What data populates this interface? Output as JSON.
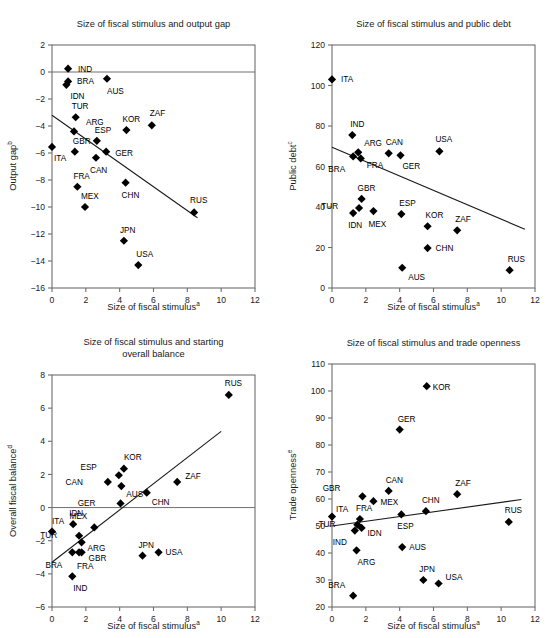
{
  "figure": {
    "panels_count": 4,
    "shared_xlabel": "Size of fiscal stimulus",
    "shared_xlabel_sup": "a"
  },
  "chart_data": [
    {
      "id": "output-gap",
      "type": "scatter",
      "title": "Size of fiscal stimulus and output gap",
      "xlabel": "Size of fiscal stimulus",
      "xlabel_sup": "a",
      "ylabel": "Output gap",
      "ylabel_sup": "b",
      "xlim": [
        0,
        12
      ],
      "ylim": [
        -16,
        2
      ],
      "xticks": [
        0,
        2,
        4,
        6,
        8,
        10,
        12
      ],
      "yticks": [
        2,
        0,
        -2,
        -4,
        -6,
        -8,
        -10,
        -12,
        -14,
        -16
      ],
      "grid": false,
      "legend": "none",
      "zero_line": 0,
      "trendline": {
        "x0": 0.0,
        "y0": -3.2,
        "x1": 8.6,
        "y1": -10.8
      },
      "points": [
        {
          "label": "IND",
          "x": 0.95,
          "y": 0.25,
          "lx": 10,
          "ly": 3
        },
        {
          "label": "BRA",
          "x": 0.95,
          "y": -0.7,
          "lx": 9,
          "ly": 3
        },
        {
          "label": "IDN",
          "x": 0.85,
          "y": -0.95,
          "lx": 4,
          "ly": 14
        },
        {
          "label": "AUS",
          "x": 3.25,
          "y": -0.5,
          "lx": 0,
          "ly": 15
        },
        {
          "label": "TUR",
          "x": 1.4,
          "y": -3.35,
          "lx": -4,
          "ly": -8
        },
        {
          "label": "ARG",
          "x": 1.3,
          "y": -4.4,
          "lx": 12,
          "ly": -6
        },
        {
          "label": "KOR",
          "x": 4.4,
          "y": -4.3,
          "lx": -4,
          "ly": -8
        },
        {
          "label": "ZAF",
          "x": 5.9,
          "y": -3.95,
          "lx": -2,
          "ly": -9
        },
        {
          "label": "ESP",
          "x": 2.65,
          "y": -5.1,
          "lx": -2,
          "ly": -8
        },
        {
          "label": "ITA",
          "x": 0.0,
          "y": -5.55,
          "lx": 2,
          "ly": 14
        },
        {
          "label": "GBR",
          "x": 1.35,
          "y": -5.9,
          "lx": -2,
          "ly": -8
        },
        {
          "label": "GER",
          "x": 3.2,
          "y": -5.9,
          "lx": 9,
          "ly": 4
        },
        {
          "label": "CAN",
          "x": 2.6,
          "y": -6.35,
          "lx": -6,
          "ly": 15
        },
        {
          "label": "FRA",
          "x": 1.5,
          "y": -8.5,
          "lx": -4,
          "ly": -8
        },
        {
          "label": "CHN",
          "x": 4.35,
          "y": -8.2,
          "lx": -4,
          "ly": 15
        },
        {
          "label": "MEX",
          "x": 1.95,
          "y": -10.0,
          "lx": -4,
          "ly": -8
        },
        {
          "label": "RUS",
          "x": 8.4,
          "y": -10.4,
          "lx": -4,
          "ly": -9
        },
        {
          "label": "JPN",
          "x": 4.25,
          "y": -12.5,
          "lx": -4,
          "ly": -8
        },
        {
          "label": "USA",
          "x": 5.1,
          "y": -14.3,
          "lx": -2,
          "ly": -8
        }
      ]
    },
    {
      "id": "public-debt",
      "type": "scatter",
      "title": "Size of fiscal stimulus and public debt",
      "xlabel": "Size of fiscal stimulus",
      "xlabel_sup": "a",
      "ylabel": "Public debt",
      "ylabel_sup": "c",
      "xlim": [
        0,
        12
      ],
      "ylim": [
        0,
        120
      ],
      "xticks": [
        0,
        2,
        4,
        6,
        8,
        10,
        12
      ],
      "yticks": [
        0,
        20,
        40,
        60,
        80,
        100,
        120
      ],
      "grid": false,
      "legend": "none",
      "trendline": {
        "x0": 0.0,
        "y0": 69.5,
        "x1": 11.4,
        "y1": 29.0
      },
      "points": [
        {
          "label": "ITA",
          "x": 0.0,
          "y": 103.0,
          "lx": 9,
          "ly": 3
        },
        {
          "label": "IND",
          "x": 1.2,
          "y": 75.5,
          "lx": -2,
          "ly": -8
        },
        {
          "label": "ARG",
          "x": 1.55,
          "y": 67.0,
          "lx": 6,
          "ly": -6
        },
        {
          "label": "BRA",
          "x": 1.25,
          "y": 65.0,
          "lx": -8,
          "ly": 16
        },
        {
          "label": "FRA",
          "x": 1.7,
          "y": 64.0,
          "lx": 6,
          "ly": 10
        },
        {
          "label": "CAN",
          "x": 3.35,
          "y": 66.5,
          "lx": -3,
          "ly": -8
        },
        {
          "label": "GER",
          "x": 4.05,
          "y": 65.5,
          "lx": 2,
          "ly": 14
        },
        {
          "label": "USA",
          "x": 6.35,
          "y": 67.5,
          "lx": -4,
          "ly": -9
        },
        {
          "label": "GBR",
          "x": 1.75,
          "y": 44.0,
          "lx": -4,
          "ly": -8
        },
        {
          "label": "TUR",
          "x": 1.6,
          "y": 39.5,
          "lx": -21,
          "ly": 1
        },
        {
          "label": "IDN",
          "x": 1.25,
          "y": 37.0,
          "lx": -5,
          "ly": 15
        },
        {
          "label": "MEX",
          "x": 2.45,
          "y": 38.0,
          "lx": -5,
          "ly": 16
        },
        {
          "label": "ESP",
          "x": 4.1,
          "y": 36.5,
          "lx": -2,
          "ly": -8
        },
        {
          "label": "KOR",
          "x": 5.65,
          "y": 30.5,
          "lx": -2,
          "ly": -8
        },
        {
          "label": "ZAF",
          "x": 7.4,
          "y": 28.5,
          "lx": -2,
          "ly": -8
        },
        {
          "label": "CHN",
          "x": 5.65,
          "y": 19.7,
          "lx": 8,
          "ly": 3
        },
        {
          "label": "AUS",
          "x": 4.15,
          "y": 10.0,
          "lx": 6,
          "ly": 12
        },
        {
          "label": "RUS",
          "x": 10.5,
          "y": 8.8,
          "lx": -2,
          "ly": -8
        }
      ]
    },
    {
      "id": "overall-balance",
      "type": "scatter",
      "title": "Size of fiscal stimulus and starting overall balance",
      "title_line1": "Size of fiscal stimulus and starting",
      "title_line2": "overall balance",
      "xlabel": "Size of fiscal stimulus",
      "xlabel_sup": "a",
      "ylabel": "Overall fiscal balance",
      "ylabel_sup": "d",
      "xlim": [
        0,
        12
      ],
      "ylim": [
        -6,
        8
      ],
      "xticks": [
        0,
        2,
        4,
        6,
        8,
        10,
        12
      ],
      "yticks": [
        8,
        6,
        4,
        2,
        0,
        -2,
        -4,
        -6
      ],
      "grid": false,
      "legend": "none",
      "zero_line": 0,
      "trendline": {
        "x0": 0.0,
        "y0": -3.3,
        "x1": 10.0,
        "y1": 4.6
      },
      "points": [
        {
          "label": "RUS",
          "x": 10.45,
          "y": 6.8,
          "lx": -4,
          "ly": -9
        },
        {
          "label": "KOR",
          "x": 4.25,
          "y": 2.35,
          "lx": 0,
          "ly": -9
        },
        {
          "label": "ESP",
          "x": 3.95,
          "y": 1.95,
          "lx": -22,
          "ly": -5
        },
        {
          "label": "CAN",
          "x": 3.3,
          "y": 1.55,
          "lx": -25,
          "ly": 3
        },
        {
          "label": "AUS",
          "x": 4.1,
          "y": 1.3,
          "lx": 5,
          "ly": 11
        },
        {
          "label": "ZAF",
          "x": 7.4,
          "y": 1.55,
          "lx": 8,
          "ly": -3
        },
        {
          "label": "CHN",
          "x": 5.6,
          "y": 0.9,
          "lx": 5,
          "ly": 12
        },
        {
          "label": "GER",
          "x": 4.05,
          "y": 0.25,
          "lx": -25,
          "ly": 3
        },
        {
          "label": "IDN",
          "x": 1.25,
          "y": -1.0,
          "lx": -4,
          "ly": -8
        },
        {
          "label": "MEX",
          "x": 2.5,
          "y": -1.2,
          "lx": -7,
          "ly": -8
        },
        {
          "label": "ITA",
          "x": 0.0,
          "y": -1.45,
          "lx": 0,
          "ly": -8
        },
        {
          "label": "TUR",
          "x": 1.6,
          "y": -1.7,
          "lx": -22,
          "ly": 2
        },
        {
          "label": "ARG",
          "x": 1.75,
          "y": -2.1,
          "lx": 6,
          "ly": 9
        },
        {
          "label": "BRA",
          "x": 1.2,
          "y": -2.7,
          "lx": -10,
          "ly": 16
        },
        {
          "label": "FRA",
          "x": 1.6,
          "y": -2.7,
          "lx": -2,
          "ly": 17
        },
        {
          "label": "GBR",
          "x": 1.75,
          "y": -2.7,
          "lx": 7,
          "ly": 9
        },
        {
          "label": "JPN",
          "x": 5.35,
          "y": -2.9,
          "lx": -4,
          "ly": -8
        },
        {
          "label": "USA",
          "x": 6.3,
          "y": -2.7,
          "lx": 7,
          "ly": 3
        },
        {
          "label": "IND",
          "x": 1.2,
          "y": -4.15,
          "lx": 1,
          "ly": 15
        }
      ]
    },
    {
      "id": "trade-openness",
      "type": "scatter",
      "title": "Size of fiscal stimulus and trade openness",
      "xlabel": "Size of fiscal stimulus",
      "xlabel_sup": "a",
      "ylabel": "Trade openness",
      "ylabel_sup": "e",
      "xlim": [
        0,
        12
      ],
      "ylim": [
        20,
        110
      ],
      "xticks": [
        0,
        2,
        4,
        6,
        8,
        10,
        12
      ],
      "yticks": [
        110,
        100,
        90,
        80,
        70,
        60,
        50,
        40,
        30,
        20
      ],
      "grid": false,
      "legend": "none",
      "trendline": {
        "x0": 0.0,
        "y0": 50.0,
        "x1": 11.2,
        "y1": 59.8
      },
      "points": [
        {
          "label": "KOR",
          "x": 5.6,
          "y": 101.8,
          "lx": 6,
          "ly": 4
        },
        {
          "label": "GER",
          "x": 4.0,
          "y": 85.7,
          "lx": -2,
          "ly": -8
        },
        {
          "label": "CAN",
          "x": 3.35,
          "y": 63.0,
          "lx": -3,
          "ly": -8
        },
        {
          "label": "ZAF",
          "x": 7.4,
          "y": 61.8,
          "lx": -2,
          "ly": -8
        },
        {
          "label": "GBR",
          "x": 1.8,
          "y": 61.0,
          "lx": -22,
          "ly": -5
        },
        {
          "label": "MEX",
          "x": 2.45,
          "y": 59.2,
          "lx": 7,
          "ly": 4
        },
        {
          "label": "CHN",
          "x": 5.55,
          "y": 55.5,
          "lx": -4,
          "ly": -8
        },
        {
          "label": "ESP",
          "x": 4.1,
          "y": 54.3,
          "lx": -4,
          "ly": 15
        },
        {
          "label": "ITA",
          "x": 0.0,
          "y": 53.5,
          "lx": 4,
          "ly": -5
        },
        {
          "label": "FRA",
          "x": 1.65,
          "y": 52.6,
          "lx": -4,
          "ly": -8
        },
        {
          "label": "RUS",
          "x": 10.45,
          "y": 51.5,
          "lx": -4,
          "ly": -9
        },
        {
          "label": "TUR",
          "x": 1.5,
          "y": 50.5,
          "lx": -22,
          "ly": 2
        },
        {
          "label": "IDN",
          "x": 1.75,
          "y": 49.3,
          "lx": 6,
          "ly": 8
        },
        {
          "label": "IND",
          "x": 1.35,
          "y": 48.3,
          "lx": -8,
          "ly": 14
        },
        {
          "label": "AUS",
          "x": 4.15,
          "y": 42.2,
          "lx": 7,
          "ly": 3
        },
        {
          "label": "ARG",
          "x": 1.45,
          "y": 41.0,
          "lx": 1,
          "ly": 15
        },
        {
          "label": "JPN",
          "x": 5.4,
          "y": 30.0,
          "lx": -4,
          "ly": -8
        },
        {
          "label": "USA",
          "x": 6.3,
          "y": 28.7,
          "lx": 7,
          "ly": -4
        },
        {
          "label": "BRA",
          "x": 1.25,
          "y": 24.2,
          "lx": -8,
          "ly": -8
        }
      ]
    }
  ]
}
